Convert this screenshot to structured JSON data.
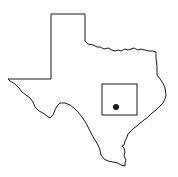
{
  "map": {
    "region": "Texas",
    "outline_color": "#1a1a1a",
    "background_color": "#ffffff",
    "highlight_box": {
      "x": 102,
      "y": 84,
      "width": 35,
      "height": 31,
      "stroke": "#1a1a1a"
    },
    "marker": {
      "cx": 116,
      "cy": 107,
      "r": 3,
      "fill": "#1a1a1a",
      "icon": "location-dot-icon"
    }
  }
}
